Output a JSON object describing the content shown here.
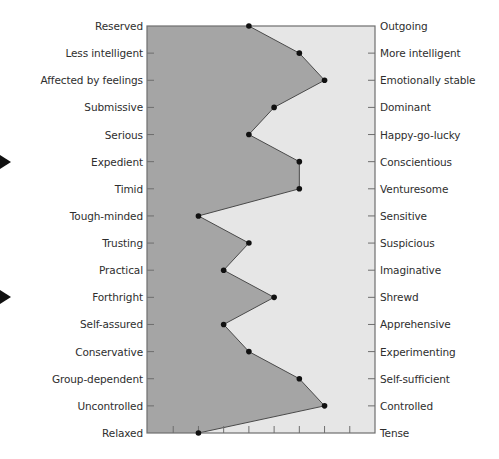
{
  "chart_data": {
    "type": "line",
    "title": "",
    "xlabel": "",
    "ylabel": "",
    "x_scale": {
      "min": 1,
      "max": 10,
      "ticks": [
        1,
        2,
        3,
        4,
        5,
        6,
        7,
        8,
        9,
        10
      ],
      "tick_labels_visible": false
    },
    "grid": false,
    "legend": null,
    "categories_left": [
      "Reserved",
      "Less intelligent",
      "Affected by feelings",
      "Submissive",
      "Serious",
      "Expedient",
      "Timid",
      "Tough-minded",
      "Trusting",
      "Practical",
      "Forthright",
      "Self-assured",
      "Conservative",
      "Group-dependent",
      "Uncontrolled",
      "Relaxed"
    ],
    "categories_right": [
      "Outgoing",
      "More intelligent",
      "Emotionally stable",
      "Dominant",
      "Happy-go-lucky",
      "Conscientious",
      "Venturesome",
      "Sensitive",
      "Suspicious",
      "Imaginative",
      "Shrewd",
      "Apprehensive",
      "Experimenting",
      "Self-sufficient",
      "Controlled",
      "Tense"
    ],
    "series": [
      {
        "name": "Profile",
        "values": [
          5,
          7,
          8,
          6,
          5,
          7,
          7,
          3,
          5,
          4,
          6,
          4,
          5,
          7,
          8,
          3
        ]
      }
    ],
    "highlighted_rows": [
      "Expedient",
      "Forthright"
    ],
    "colors": {
      "left_fill": "#a5a5a5",
      "right_fill": "#e6e6e6",
      "line": "#4a4a4a",
      "point": "#111111",
      "frame": "#6e6e6e"
    }
  }
}
